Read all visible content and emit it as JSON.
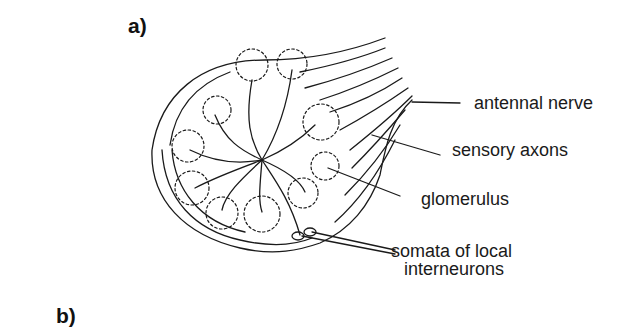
{
  "figure": {
    "panels": [
      {
        "id": "a",
        "label": "a)"
      },
      {
        "id": "b",
        "label": "b)"
      }
    ],
    "annotations": [
      {
        "id": "antennal-nerve",
        "text": "antennal nerve"
      },
      {
        "id": "sensory-axons",
        "text": "sensory axons"
      },
      {
        "id": "glomerulus",
        "text": "glomerulus"
      },
      {
        "id": "somata",
        "text": "somata of local",
        "text2": "interneurons"
      }
    ],
    "colors": {
      "ink": "#1a1a1a",
      "background": "#ffffff"
    }
  }
}
